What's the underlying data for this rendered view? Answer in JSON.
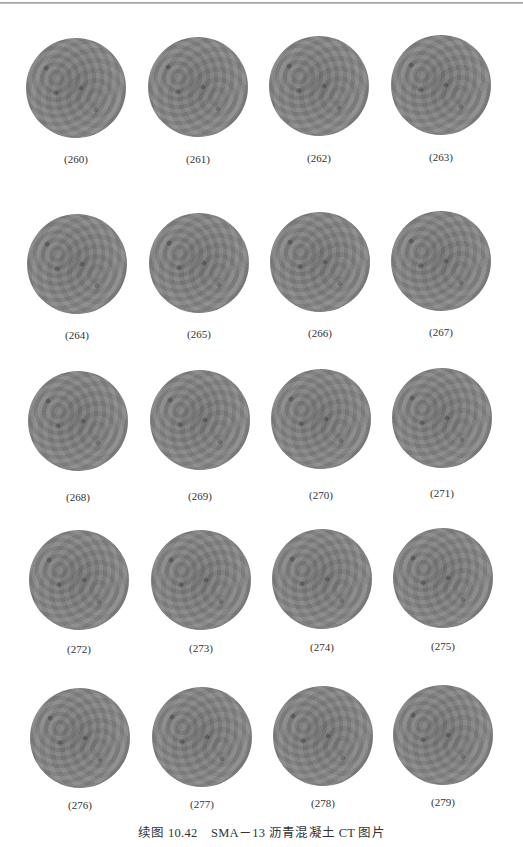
{
  "figure": {
    "caption": "续图 10.42　SMA－13 沥青混凝土 CT 图片",
    "rows": [
      {
        "items": [
          {
            "label": "(260)"
          },
          {
            "label": "(261)"
          },
          {
            "label": "(262)"
          },
          {
            "label": "(263)"
          }
        ]
      },
      {
        "items": [
          {
            "label": "(264)"
          },
          {
            "label": "(265)"
          },
          {
            "label": "(266)"
          },
          {
            "label": "(267)"
          }
        ]
      },
      {
        "items": [
          {
            "label": "(268)"
          },
          {
            "label": "(269)"
          },
          {
            "label": "(270)"
          },
          {
            "label": "(271)"
          }
        ]
      },
      {
        "items": [
          {
            "label": "(272)"
          },
          {
            "label": "(273)"
          },
          {
            "label": "(274)"
          },
          {
            "label": "(275)"
          }
        ]
      },
      {
        "items": [
          {
            "label": "(276)"
          },
          {
            "label": "(277)"
          },
          {
            "label": "(278)"
          },
          {
            "label": "(279)"
          }
        ]
      }
    ],
    "image_description": "circular grayscale CT cross-section of asphalt concrete specimen"
  }
}
